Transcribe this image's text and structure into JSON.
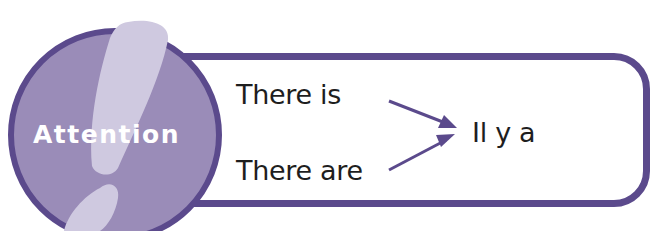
{
  "badge": {
    "label": "Attention",
    "icon": "exclamation-icon"
  },
  "content": {
    "left_items": [
      "There is",
      "There are"
    ],
    "right_item": "Il y a"
  },
  "colors": {
    "border": "#5b4a8c",
    "circle_fill": "#9a8cb8",
    "exclamation": "#cfc9e0",
    "text": "#1e1e1e",
    "arrow": "#5b4a8c"
  }
}
